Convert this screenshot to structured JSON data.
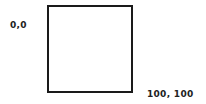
{
  "diagram": {
    "box": {
      "stroke_color": "#1a1a1a",
      "fill_color": "#ffffff"
    },
    "labels": {
      "origin": "0,0",
      "end": "100, 100"
    }
  }
}
